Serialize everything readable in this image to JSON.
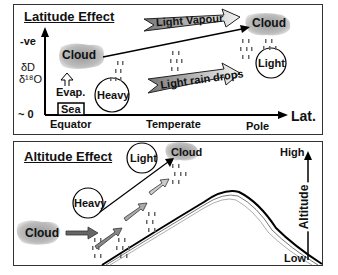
{
  "latitude_panel": {
    "title": "Latitude Effect",
    "y_axis": {
      "top": "-ve",
      "bottom": "~ 0",
      "label_line1": "δD",
      "label_line2": "δ¹⁸O"
    },
    "x_axis": {
      "label": "Lat.",
      "ticks": [
        "Equator",
        "Temperate",
        "Pole"
      ]
    },
    "source": {
      "sea": "Sea",
      "evap": "Evap."
    },
    "clouds": [
      "Cloud",
      "Cloud"
    ],
    "drops": [
      "Heavy",
      "Light"
    ],
    "arrows": [
      "Light Vapour",
      "Light rain drops"
    ]
  },
  "altitude_panel": {
    "title": "Altitude Effect",
    "clouds": [
      "Cloud",
      "Cloud"
    ],
    "drops": [
      "Heavy",
      "Light"
    ],
    "axis": {
      "label": "Altitude",
      "high": "High",
      "low": "Low"
    }
  }
}
